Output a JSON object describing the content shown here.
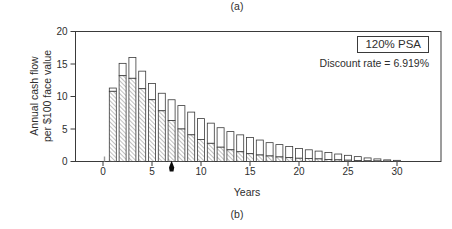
{
  "figure": {
    "label_a": "(a)",
    "label_b": "(b)"
  },
  "chart_data": {
    "type": "bar",
    "stacked": true,
    "title": "",
    "xlabel": "Years",
    "ylabel_line1": "Annual cash flow",
    "ylabel_line2": "per $100 face value",
    "ylim": [
      0,
      20
    ],
    "x_ticks": [
      0,
      5,
      10,
      15,
      20,
      25,
      30
    ],
    "y_ticks": [
      0,
      5,
      10,
      15,
      20
    ],
    "grid": false,
    "legend_position": "top-right-inside",
    "years": [
      1,
      2,
      3,
      4,
      5,
      6,
      7,
      8,
      9,
      10,
      11,
      12,
      13,
      14,
      15,
      16,
      17,
      18,
      19,
      20,
      21,
      22,
      23,
      24,
      25,
      26,
      27,
      28,
      29,
      30
    ],
    "series": [
      {
        "name": "hatched-lower-segment",
        "appearance": "diagonal-hatch",
        "values": [
          10.8,
          13.2,
          12.8,
          11.2,
          9.5,
          7.8,
          6.3,
          5.0,
          4.1,
          3.4,
          2.8,
          2.2,
          1.8,
          1.5,
          1.2,
          1.0,
          0.85,
          0.7,
          0.6,
          0.5,
          0.45,
          0.4,
          0.3,
          0.25,
          0.2,
          0.15,
          0.1,
          0.08,
          0.05,
          0.03
        ]
      },
      {
        "name": "white-upper-segment",
        "appearance": "white",
        "values": [
          0.5,
          1.9,
          3.2,
          2.7,
          2.5,
          2.7,
          3.2,
          3.6,
          3.5,
          3.2,
          3.1,
          3.0,
          2.8,
          2.6,
          2.5,
          2.3,
          2.05,
          1.9,
          1.7,
          1.5,
          1.35,
          1.2,
          1.1,
          0.9,
          0.75,
          0.6,
          0.45,
          0.32,
          0.2,
          0.15
        ]
      }
    ],
    "stack_totals": [
      11.3,
      15.1,
      16.0,
      13.9,
      12.0,
      10.5,
      9.5,
      8.6,
      7.6,
      6.6,
      5.9,
      5.2,
      4.6,
      4.1,
      3.7,
      3.3,
      2.9,
      2.6,
      2.3,
      2.0,
      1.8,
      1.6,
      1.4,
      1.15,
      0.95,
      0.75,
      0.55,
      0.4,
      0.25,
      0.18
    ],
    "axis_marker_x": 7,
    "annotations": {
      "psa": "120% PSA",
      "discount": "Discount rate = 6.919%"
    }
  }
}
